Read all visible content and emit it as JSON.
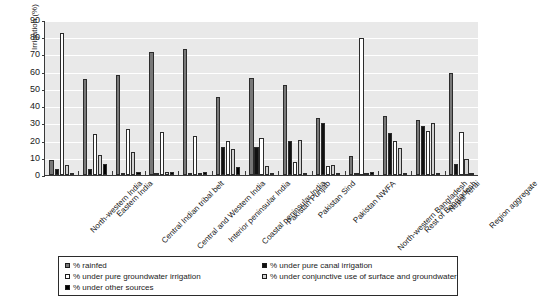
{
  "chart_data": {
    "type": "bar",
    "title": "",
    "xlabel": "",
    "ylabel": "Irrigation (%)",
    "ylim": [
      0,
      90
    ],
    "yticks": [
      0,
      10,
      20,
      30,
      40,
      50,
      60,
      70,
      80,
      90
    ],
    "grid": true,
    "legend_position": "bottom",
    "categories": [
      "North-western India",
      "Eastern India",
      "Central Indian tribal belt",
      "Central and Western India",
      "Interior peninsular India",
      "Coastal peninsular India",
      "Pakistan Punjab",
      "Pakistan Sind",
      "Pakistan NWFA",
      "North-western Bangladesh",
      "Rest of Bangladesh",
      "Nepal Terai",
      "Region aggregate"
    ],
    "series": [
      {
        "name": "% rainfed",
        "color": "#787878",
        "values": [
          8.5,
          55.5,
          58.0,
          71.5,
          73.0,
          45.5,
          56.5,
          52.5,
          33.0,
          11.0,
          34.0,
          32.0,
          59.5
        ]
      },
      {
        "name": "% under pure canal irrigation",
        "color": "#111111",
        "values": [
          3.5,
          3.5,
          1.0,
          1.0,
          1.0,
          16.0,
          16.0,
          20.0,
          30.0,
          0.5,
          24.5,
          28.5,
          6.5
        ]
      },
      {
        "name": "% under pure groundwater irrigation",
        "color": "#ffffff",
        "values": [
          82.5,
          24.0,
          26.5,
          25.0,
          22.5,
          20.0,
          21.5,
          7.5,
          5.5,
          79.5,
          20.0,
          25.5,
          25.0
        ]
      },
      {
        "name": "% under conjunctive use of  surface and groundwater",
        "color": "#d2d2d2",
        "values": [
          6.0,
          11.5,
          13.5,
          1.5,
          1.0,
          15.0,
          5.0,
          20.5,
          6.0,
          1.0,
          15.5,
          30.0,
          9.5
        ]
      },
      {
        "name": "% under other sources",
        "color": "#000000",
        "values": [
          0.3,
          6.5,
          1.5,
          1.5,
          2.0,
          4.5,
          0.3,
          0.3,
          0.3,
          1.5,
          0.5,
          0.5,
          1.0
        ]
      }
    ]
  },
  "legend": {
    "items": [
      {
        "label": "% rainfed",
        "swatch": "#787878"
      },
      {
        "label": "% under pure canal irrigation",
        "swatch": "#111111"
      },
      {
        "label": "% under pure groundwater irrigation",
        "swatch": "#ffffff"
      },
      {
        "label": "% under conjunctive use of  surface and groundwater",
        "swatch": "#d2d2d2"
      },
      {
        "label": "% under other sources",
        "swatch": "#000000"
      }
    ]
  }
}
